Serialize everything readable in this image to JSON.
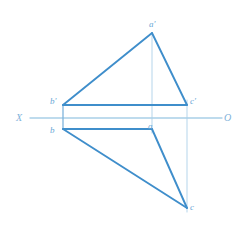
{
  "drawing": {
    "title": "Orthographic projection of triangle ABC",
    "type": "descriptive-geometry-projection",
    "canvas": {
      "width": 240,
      "height": 247
    },
    "colors": {
      "object_line": "#3f8ecb",
      "object_line_light": "#5f9fd4",
      "axis_line": "#a9cfe8",
      "projector_line": "#bcd9ed",
      "label_text": "#6aa6d6",
      "axis_label_text": "#7fb2da",
      "background": "#ffffff"
    },
    "axis": {
      "name": "ground-line",
      "left_label": "X",
      "right_label": "O",
      "y": 118,
      "x_start": 30,
      "x_end": 222,
      "left_label_x": 16,
      "left_label_y": 113,
      "right_label_x": 224,
      "right_label_y": 113
    },
    "points": [
      {
        "id": "a-prime",
        "label": "a'",
        "x": 152,
        "y": 33,
        "label_x": 149,
        "label_y": 20,
        "view": "front"
      },
      {
        "id": "b-prime",
        "label": "b'",
        "x": 63,
        "y": 105,
        "label_x": 50,
        "label_y": 97,
        "view": "front"
      },
      {
        "id": "c-prime",
        "label": "c'",
        "x": 187,
        "y": 105,
        "label_x": 190,
        "label_y": 97,
        "view": "front"
      },
      {
        "id": "a",
        "label": "a",
        "x": 152,
        "y": 129,
        "label_x": 148,
        "label_y": 122,
        "view": "top"
      },
      {
        "id": "b",
        "label": "b",
        "x": 63,
        "y": 129,
        "label_x": 50,
        "label_y": 126,
        "view": "top"
      },
      {
        "id": "c",
        "label": "c",
        "x": 187,
        "y": 208,
        "label_x": 190,
        "label_y": 203,
        "view": "top"
      }
    ],
    "object_edges": [
      {
        "id": "edge-bprime-aprime",
        "from": "b-prime",
        "to": "a-prime"
      },
      {
        "id": "edge-aprime-cprime",
        "from": "a-prime",
        "to": "c-prime"
      },
      {
        "id": "edge-bprime-cprime",
        "from": "b-prime",
        "to": "c-prime"
      },
      {
        "id": "edge-b-a",
        "from": "b",
        "to": "a"
      },
      {
        "id": "edge-a-c",
        "from": "a",
        "to": "c"
      },
      {
        "id": "edge-b-c",
        "from": "b",
        "to": "c"
      }
    ],
    "connector_edges": [
      {
        "id": "connector-bprime-b",
        "from": "b-prime",
        "to": "b"
      }
    ],
    "projector_lines": [
      {
        "id": "projector-a",
        "x": 152,
        "y_start": 33,
        "y_end": 133
      },
      {
        "id": "projector-c",
        "x": 187,
        "y_start": 100,
        "y_end": 212
      }
    ]
  }
}
